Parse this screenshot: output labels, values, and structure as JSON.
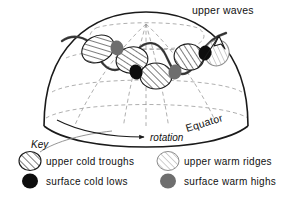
{
  "figure": {
    "title_label": "upper waves",
    "equator_label": "Equator",
    "rotation_label": "rotation",
    "key_title": "Key"
  },
  "legend": {
    "items": [
      {
        "id": "upper-cold-troughs",
        "label": "upper cold troughs",
        "symbol": "hatched-ellipse-dark",
        "color": "#1a1a1a",
        "fill": "#ffffff"
      },
      {
        "id": "upper-warm-ridges",
        "label": "upper warm ridges",
        "symbol": "hatched-ellipse-light",
        "color": "#8d8d8d",
        "fill": "#ffffff"
      },
      {
        "id": "surface-cold-lows",
        "label": "surface cold lows",
        "symbol": "filled-circle-black",
        "color": "#0d0d0d",
        "fill": "#0d0d0d"
      },
      {
        "id": "surface-warm-highs",
        "label": "surface warm highs",
        "symbol": "filled-circle-gray",
        "color": "#6e6e6e",
        "fill": "#6e6e6e"
      }
    ]
  },
  "globe": {
    "outline_color": "#1a1a1a",
    "grid_color": "#9a9a9a",
    "grid_style": "dashed",
    "wave_color": "#333333",
    "description": "northern hemisphere dome viewed from low latitude"
  },
  "markers": {
    "upper_cold_troughs": [
      {
        "cx": 98,
        "cy": 49,
        "rx": 17,
        "ry": 13,
        "rot": -28
      },
      {
        "cx": 132,
        "cy": 60,
        "rx": 16,
        "ry": 13,
        "rot": -12
      },
      {
        "cx": 156,
        "cy": 76,
        "rx": 16,
        "ry": 13,
        "rot": 0
      },
      {
        "cx": 189,
        "cy": 57,
        "rx": 15,
        "ry": 13,
        "rot": 12
      }
    ],
    "upper_warm_ridges": [
      {
        "cx": 216,
        "cy": 53,
        "rx": 12,
        "ry": 13,
        "rot": 22
      }
    ],
    "surface_cold_lows": [
      {
        "cx": 136,
        "cy": 72,
        "r": 6.5
      },
      {
        "cx": 205,
        "cy": 53,
        "r": 6.5
      }
    ],
    "surface_warm_highs": [
      {
        "cx": 117,
        "cy": 48,
        "r": 6.5
      },
      {
        "cx": 175,
        "cy": 72,
        "r": 6.5
      }
    ]
  }
}
